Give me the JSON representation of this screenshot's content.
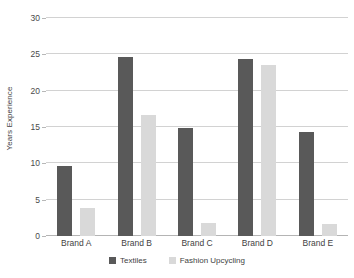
{
  "chart_data": {
    "type": "bar",
    "title": "",
    "subtitle": "",
    "xlabel": "",
    "ylabel": "Years Experience",
    "categories": [
      "Brand A",
      "Brand B",
      "Brand C",
      "Brand D",
      "Brand E"
    ],
    "series": [
      {
        "name": "Textiles",
        "color": "#595959",
        "values": [
          9.7,
          24.6,
          14.8,
          24.3,
          14.3
        ]
      },
      {
        "name": "Fashion Upcycling",
        "color": "#d9d9d9",
        "values": [
          3.9,
          16.7,
          1.8,
          23.5,
          1.7
        ]
      }
    ],
    "ylim": [
      0,
      30
    ],
    "yticks": [
      0,
      5,
      10,
      15,
      20,
      25,
      30
    ],
    "ytick_labels": [
      "0",
      "5",
      "10",
      "15",
      "20",
      "25",
      "30"
    ],
    "grid": true,
    "grid_axis": "y",
    "legend_position": "bottom",
    "background_color": "#ffffff",
    "grid_color": "#d2d2d2"
  },
  "legend": {
    "items": [
      {
        "label": "Textiles"
      },
      {
        "label": "Fashion Upcycling"
      }
    ]
  }
}
